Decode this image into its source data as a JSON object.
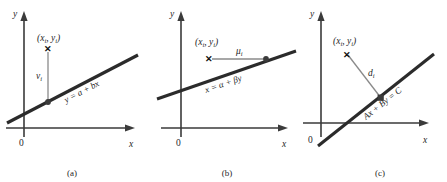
{
  "figure": {
    "type": "diagram",
    "panels": [
      {
        "id": "a",
        "caption": "(a)",
        "axis_y_label": "y",
        "axis_x_label": "x",
        "origin_label": "0",
        "point_label_open": "(",
        "point_label": "(xᵢ, yᵢ)",
        "point_x_var": "x",
        "point_y_var": "y",
        "point_sub": "i",
        "marker_glyph": "✕",
        "deviation_label": "v",
        "deviation_sub": "i",
        "deviation_kind": "vertical",
        "line_equation_parts": [
          "y",
          " = ",
          "a",
          " + ",
          "b",
          "x"
        ],
        "line_equation": "y = a + bx"
      },
      {
        "id": "b",
        "caption": "(b)",
        "axis_y_label": "y",
        "axis_x_label": "x",
        "origin_label": "0",
        "point_label": "(xᵢ, yᵢ)",
        "point_x_var": "x",
        "point_y_var": "y",
        "point_sub": "i",
        "marker_glyph": "✕",
        "deviation_label": "μ",
        "deviation_sub": "i",
        "deviation_kind": "horizontal",
        "line_equation_parts": [
          "x",
          " = ",
          "α",
          " + ",
          "β",
          "y"
        ],
        "line_equation": "x = α + βy"
      },
      {
        "id": "c",
        "caption": "(c)",
        "axis_y_label": "y",
        "axis_x_label": "x",
        "origin_label": "0",
        "point_label": "(xᵢ, yᵢ)",
        "point_x_var": "x",
        "point_y_var": "y",
        "point_sub": "i",
        "marker_glyph": "✕",
        "deviation_label": "d",
        "deviation_sub": "i",
        "deviation_kind": "perpendicular",
        "line_equation_parts": [
          "A",
          "x",
          " + ",
          "B",
          "y",
          " = ",
          "C"
        ],
        "line_equation": "Ax + By = C"
      }
    ],
    "colors": {
      "axis": "#3a3a3a",
      "line": "#2b2b2b",
      "deviation": "#8a8a8a",
      "marker": "#3b3b3b",
      "text": "#1f1f1f",
      "background": "#ffffff"
    }
  }
}
